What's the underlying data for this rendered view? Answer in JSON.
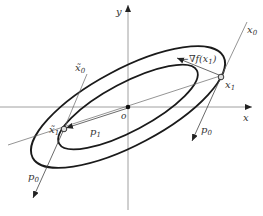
{
  "figure": {
    "axes": {
      "x_label": "x",
      "y_label": "y",
      "origin_label": "o"
    },
    "points": {
      "x0": "x",
      "x0_sub": "0",
      "x1": "x",
      "x1_sub": "1",
      "xt0": "x̃",
      "xt0_sub": "0",
      "xt1": "x̃",
      "xt1_sub": "1"
    },
    "vectors": {
      "neg_grad": "−∇f(x",
      "neg_grad_sub": "1",
      "neg_grad_close": ")",
      "p0": "p",
      "p0_sub": "0",
      "p1": "p",
      "p1_sub": "1"
    },
    "colors": {
      "curve": "#1a1a1a",
      "line": "#555555",
      "axis": "#777777",
      "text": "#333333"
    }
  }
}
